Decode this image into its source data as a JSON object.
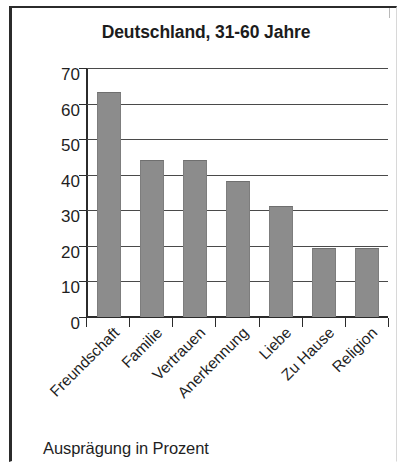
{
  "figure": {
    "caption": "Ausprägung in Prozent"
  },
  "chart_data": {
    "type": "bar",
    "title": "Deutschland, 31-60 Jahre",
    "xlabel": "",
    "ylabel": "",
    "categories": [
      "Freundschaft",
      "Familie",
      "Vertrauen",
      "Anerkennung",
      "Liebe",
      "Zu Hause",
      "Religion"
    ],
    "values": [
      63,
      44,
      44,
      38,
      31,
      19,
      19
    ],
    "ylim": [
      0,
      70
    ],
    "yticks": [
      0,
      10,
      20,
      30,
      40,
      50,
      60,
      70
    ],
    "ytick_labels": [
      "0",
      "10",
      "20",
      "30",
      "40",
      "50",
      "60",
      "70"
    ],
    "grid": true,
    "legend": null,
    "bar_color": "#8c8c8c",
    "axis_color": "#2b2b2b",
    "caption": "Ausprägung in Prozent"
  }
}
